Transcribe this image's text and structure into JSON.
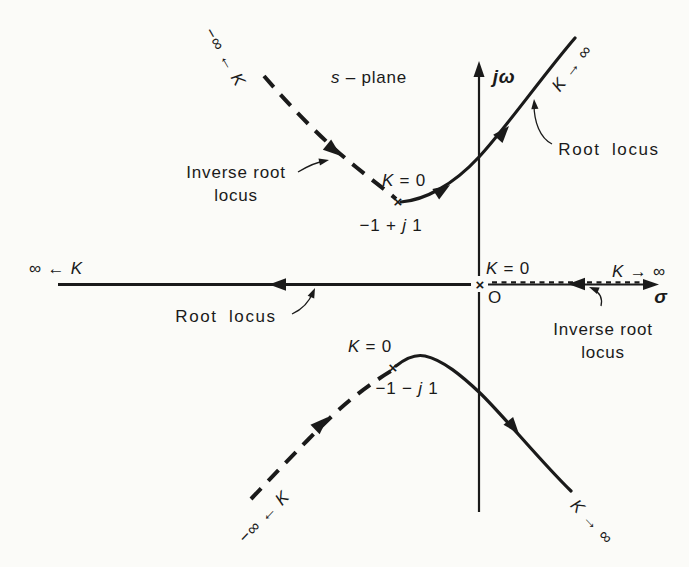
{
  "figure": {
    "background": "#fbfbf8",
    "ink": "#1a1a1a"
  },
  "plane": {
    "s": "s",
    "rest": " – plane"
  },
  "axes": {
    "vertical_label": "jω",
    "horizontal_label": "σ",
    "origin_label": "O"
  },
  "loci": {
    "root_locus_upper": "Root locus",
    "root_locus_left": "Root locus",
    "inverse_upper": {
      "line1": "Inverse root",
      "line2": "locus"
    },
    "inverse_lower": {
      "line1": "Inverse root",
      "line2": "locus"
    }
  },
  "poles": {
    "upper": {
      "marker": "×",
      "gain": {
        "k": "K",
        "rest": " = 0"
      },
      "value": {
        "pre": "−1 + ",
        "j": "j",
        "post": " 1"
      }
    },
    "lower": {
      "marker": "×",
      "gain": {
        "k": "K",
        "rest": " = 0"
      },
      "value": {
        "pre": "−1 − ",
        "j": "j",
        "post": " 1"
      }
    },
    "origin": {
      "marker": "×",
      "gain": {
        "k": "K",
        "rest": " = 0"
      }
    }
  },
  "gains": {
    "upper_right": {
      "k": "K",
      "rest": " → ∞"
    },
    "lower_right": {
      "k": "K",
      "rest": " → ∞"
    },
    "axis_right": {
      "k": "K",
      "rest": " → ∞"
    },
    "axis_left": {
      "pre": "∞ ← ",
      "k": "K"
    },
    "upper_left": {
      "pre": "−∞ ← ",
      "k": "K"
    },
    "lower_left": {
      "pre": "−∞ ← ",
      "k": "K"
    }
  }
}
